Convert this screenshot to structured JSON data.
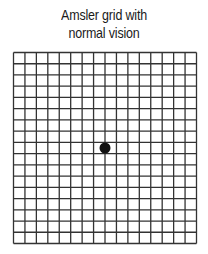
{
  "title": {
    "line1": "Amsler grid with",
    "line2": "normal vision"
  },
  "grid": {
    "columns": 16,
    "rows": 17,
    "left": 13.5,
    "top": 52.5,
    "right": 196.5,
    "bottom": 243.5,
    "line_color": "#333333",
    "dot_color": "#111111",
    "dot_center": [
      105,
      148
    ],
    "dot_radius": 5.5
  }
}
